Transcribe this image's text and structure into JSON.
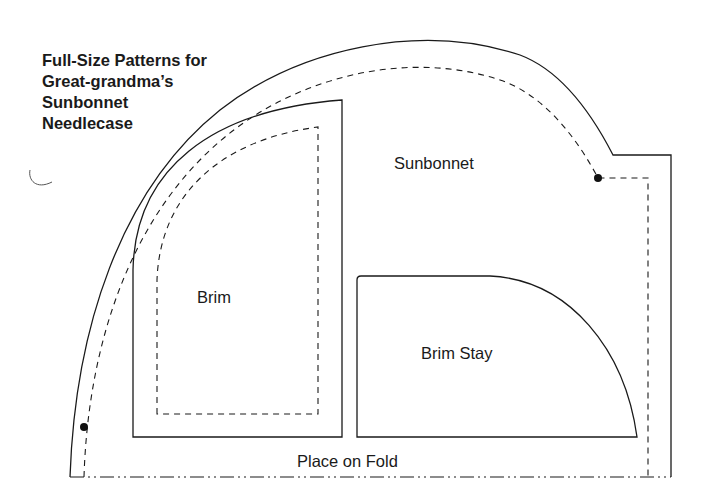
{
  "title": {
    "lines": [
      "Full-Size Patterns for",
      "Great-grandma’s",
      "Sunbonnet",
      "Needlecase"
    ]
  },
  "pieces": {
    "sunbonnet": {
      "label": "Sunbonnet"
    },
    "brim": {
      "label": "Brim"
    },
    "brim_stay": {
      "label": "Brim Stay"
    }
  },
  "fold": {
    "label": "Place on Fold"
  },
  "colors": {
    "line": "#1a1a1a",
    "background": "#ffffff"
  }
}
